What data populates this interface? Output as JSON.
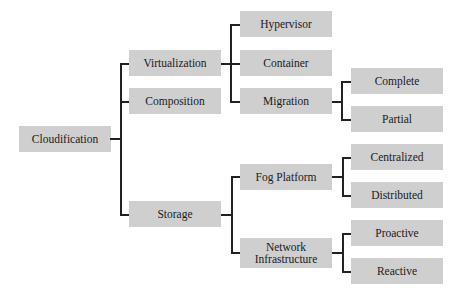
{
  "diagram": {
    "type": "tree",
    "root": {
      "label": "Cloudification",
      "children": [
        {
          "label": "Virtualization",
          "children": [
            {
              "label": "Hypervisor"
            },
            {
              "label": "Container"
            },
            {
              "label": "Migration",
              "children": [
                {
                  "label": "Complete"
                },
                {
                  "label": "Partial"
                }
              ]
            }
          ]
        },
        {
          "label": "Composition"
        },
        {
          "label": "Storage",
          "children": [
            {
              "label": "Fog Platform",
              "children": [
                {
                  "label": "Centralized"
                },
                {
                  "label": "Distributed"
                }
              ]
            },
            {
              "label": "Network Infrastructure",
              "children": [
                {
                  "label": "Proactive"
                },
                {
                  "label": "Reactive"
                }
              ]
            }
          ]
        }
      ]
    },
    "nodes": {
      "cloudification": "Cloudification",
      "virtualization": "Virtualization",
      "composition": "Composition",
      "storage": "Storage",
      "hypervisor": "Hypervisor",
      "container": "Container",
      "migration": "Migration",
      "complete": "Complete",
      "partial": "Partial",
      "fog_platform": "Fog Platform",
      "network_infrastructure_line1": "Network",
      "network_infrastructure_line2": "Infrastructure",
      "centralized": "Centralized",
      "distributed": "Distributed",
      "proactive": "Proactive",
      "reactive": "Reactive"
    },
    "colors": {
      "node_fill": "#cfcfcf",
      "connector": "#222222",
      "text": "#1a1a1a"
    }
  }
}
